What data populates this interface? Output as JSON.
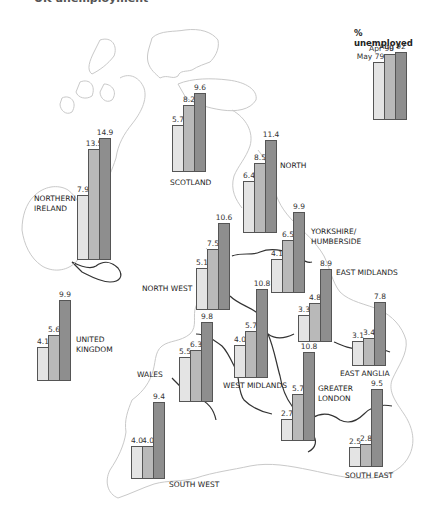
{
  "title": "UK unemployment",
  "legend": {
    "title": "% unemployed",
    "series": [
      "May 79",
      "Apr 90",
      "Aug 92"
    ],
    "colors": [
      "#e4e4e4",
      "#b9b9b9",
      "#8e8e8e"
    ]
  },
  "chart_data": {
    "type": "bar",
    "xlabel": "",
    "ylabel": "% unemployed",
    "grid": false,
    "legend_position": "top-right",
    "series_names": [
      "May 79",
      "Apr 90",
      "Aug 92"
    ],
    "categories": [
      "Scotland",
      "Northern Ireland",
      "North",
      "North West",
      "Yorkshire/Humberside",
      "East Midlands",
      "United Kingdom",
      "Wales",
      "West Midlands",
      "East Anglia",
      "Greater London",
      "South West",
      "South East"
    ],
    "series": [
      {
        "name": "May 79",
        "values": [
          5.7,
          7.9,
          6.4,
          5.1,
          4.1,
          3.3,
          4.1,
          5.5,
          4.0,
          3.1,
          2.7,
          4.0,
          2.5
        ]
      },
      {
        "name": "Apr 90",
        "values": [
          8.2,
          13.5,
          8.5,
          7.5,
          6.5,
          4.8,
          5.6,
          6.3,
          5.7,
          3.4,
          5.7,
          4.0,
          2.8
        ]
      },
      {
        "name": "Aug 92",
        "values": [
          9.6,
          14.9,
          11.4,
          10.6,
          9.9,
          8.9,
          9.9,
          9.8,
          10.8,
          7.8,
          10.8,
          9.4,
          9.5
        ]
      }
    ]
  },
  "regions": [
    {
      "name": "Scotland",
      "label": "SCOTLAND",
      "x": 172,
      "y": 172,
      "values": [
        "5.7",
        "8.2",
        "9.6"
      ],
      "label_x": -2,
      "label_y": 6
    },
    {
      "name": "Northern Ireland",
      "label": "NORTHERN\nIRELAND",
      "x": 77,
      "y": 260,
      "values": [
        "7.9",
        "13.5",
        "14.9"
      ],
      "label_x": -43,
      "label_y": -66
    },
    {
      "name": "North",
      "label": "NORTH",
      "x": 243,
      "y": 233,
      "values": [
        "6.4",
        "8.5",
        "11.4"
      ],
      "label_x": 37,
      "label_y": -72
    },
    {
      "name": "North West",
      "label": "NORTH WEST",
      "x": 196,
      "y": 310,
      "values": [
        "5.1",
        "7.5",
        "10.6"
      ],
      "label_x": -54,
      "label_y": -26
    },
    {
      "name": "Yorkshire/Humberside",
      "label": "YORKSHIRE/\nHUMBERSIDE",
      "x": 271,
      "y": 293,
      "values": [
        "4.1",
        "6.5",
        "9.9"
      ],
      "label_x": 40,
      "label_y": -66
    },
    {
      "name": "East Midlands",
      "label": "EAST MIDLANDS",
      "x": 298,
      "y": 342,
      "values": [
        "3.3",
        "4.8",
        "8.9"
      ],
      "label_x": 38,
      "label_y": -74
    },
    {
      "name": "United Kingdom",
      "label": "UNITED\nKINGDOM",
      "x": 37,
      "y": 381,
      "values": [
        "4.1",
        "5.6",
        "9.9"
      ],
      "label_x": 39,
      "label_y": -46
    },
    {
      "name": "Wales",
      "label": "WALES",
      "x": 179,
      "y": 402,
      "values": [
        "5.5",
        "6.3",
        "9.8"
      ],
      "label_x": -42,
      "label_y": -32
    },
    {
      "name": "West Midlands",
      "label": "WEST MIDLANDS",
      "x": 234,
      "y": 378,
      "values": [
        "4.0",
        "5.7",
        "10.8"
      ],
      "label_x": -11,
      "label_y": 3
    },
    {
      "name": "East Anglia",
      "label": "EAST ANGLIA",
      "x": 352,
      "y": 366,
      "values": [
        "3.1",
        "3.4",
        "7.8"
      ],
      "label_x": -12,
      "label_y": 3
    },
    {
      "name": "Greater London",
      "label": "GREATER\nLONDON",
      "x": 281,
      "y": 441,
      "values": [
        "2.7",
        "5.7",
        "10.8"
      ],
      "label_x": 37,
      "label_y": -57
    },
    {
      "name": "South West",
      "label": "SOUTH WEST",
      "x": 131,
      "y": 479,
      "values": [
        "4.0",
        "4.0",
        "9.4"
      ],
      "label_x": 38,
      "label_y": 1
    },
    {
      "name": "South East",
      "label": "SOUTH EAST",
      "x": 349,
      "y": 467,
      "values": [
        "2.5",
        "2.8",
        "9.5"
      ],
      "label_x": -4,
      "label_y": 4
    }
  ],
  "legend_group": {
    "x": 373,
    "y": 120,
    "values": [
      7.9,
      9.0,
      9.2
    ],
    "labels": [
      "May 79",
      "Apr 90",
      "Aug 92"
    ]
  }
}
